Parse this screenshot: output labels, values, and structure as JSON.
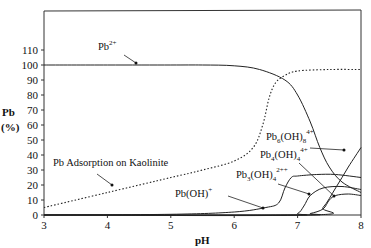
{
  "chart_data": {
    "type": "line",
    "title": "",
    "xlabel": "pH",
    "ylabel": "Pb (%)",
    "ylabel_line1": "Pb",
    "ylabel_line2": "(%)",
    "xlim": [
      3,
      8
    ],
    "ylim": [
      0,
      110
    ],
    "xticks": [
      "3",
      "4",
      "5",
      "6",
      "7",
      "8"
    ],
    "yticks": [
      "0",
      "10",
      "20",
      "30",
      "40",
      "50",
      "60",
      "70",
      "80",
      "90",
      "100",
      "110"
    ],
    "grid": false,
    "legend": "inline annotations with arrows",
    "series": [
      {
        "name": "Pb2+",
        "style": "solid",
        "x": [
          3,
          4,
          5,
          5.5,
          6,
          6.4,
          6.8,
          7.0,
          7.2,
          7.35,
          7.5,
          7.7,
          8.0
        ],
        "y": [
          100,
          100,
          100,
          100,
          99.5,
          97,
          90,
          80,
          62,
          45,
          32,
          22,
          15
        ]
      },
      {
        "name": "Pb Adsorption on Kaolinite",
        "style": "dotted",
        "x": [
          3,
          4,
          5,
          5.5,
          6,
          6.3,
          6.45,
          6.55,
          6.65,
          6.8,
          7.0,
          7.5,
          8.0
        ],
        "y": [
          5,
          15,
          25,
          30,
          36,
          45,
          60,
          78,
          88,
          93,
          96,
          97,
          97
        ]
      },
      {
        "name": "Pb(OH)+",
        "style": "solid",
        "x": [
          3,
          5,
          6,
          6.5,
          6.7,
          6.8,
          6.9,
          7.0,
          7.3,
          7.6,
          8.0
        ],
        "y": [
          0,
          0.5,
          2,
          5,
          8,
          18,
          25,
          26,
          27,
          27,
          25
        ]
      },
      {
        "name": "Pb3(OH)4 2+",
        "style": "solid",
        "x": [
          3,
          6.8,
          7.0,
          7.1,
          7.2,
          7.4,
          7.7,
          8.0
        ],
        "y": [
          0,
          0,
          1,
          6,
          13,
          18,
          19,
          17
        ]
      },
      {
        "name": "Pb4(OH)4 4+",
        "style": "solid",
        "x": [
          3,
          7.0,
          7.2,
          7.4,
          7.5,
          7.6,
          7.8,
          8.0
        ],
        "y": [
          0,
          0,
          1,
          4,
          10,
          13,
          14,
          13
        ]
      },
      {
        "name": "Pb6(OH)8 4+",
        "style": "solid",
        "x": [
          3,
          7.2,
          7.4,
          7.6,
          7.8,
          8.0
        ],
        "y": [
          0,
          0,
          5,
          18,
          32,
          45
        ]
      }
    ],
    "annotations": [
      {
        "text": "Pb",
        "sup": "2+",
        "x": 4.0,
        "y": 111
      },
      {
        "text": "Pb Adsorption on Kaolinite",
        "x": 3.15,
        "y": 29
      },
      {
        "text": "Pb(OH)",
        "sup": "+",
        "x": 5.55,
        "y": 13
      },
      {
        "text": "Pb3(OH)4",
        "sup": "2++",
        "x": 6.6,
        "y": 23
      },
      {
        "text": "Pb4(OH)4",
        "sup": "4+",
        "x": 6.85,
        "y": 32
      },
      {
        "text": "Pb6(OH)8",
        "sup": "4+",
        "x": 6.95,
        "y": 41
      }
    ]
  },
  "labels": {
    "pb2": {
      "base": "Pb",
      "sup": "2+"
    },
    "adsorption": "Pb Adsorption on Kaolinite",
    "pboh": {
      "base": "Pb(OH)",
      "sup": "+"
    },
    "pb3": {
      "base": "Pb",
      "sub1": "3",
      "mid": "(OH)",
      "sub2": "4",
      "sup": "2++"
    },
    "pb4": {
      "base": "Pb",
      "sub1": "4",
      "mid": "(OH)",
      "sub2": "4",
      "sup": "4+"
    },
    "pb6": {
      "base": "Pb",
      "sub1": "6",
      "mid": "(OH)",
      "sub2": "8",
      "sup": "4+"
    }
  }
}
